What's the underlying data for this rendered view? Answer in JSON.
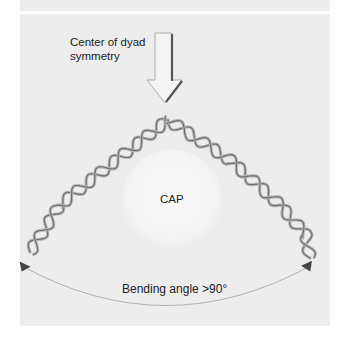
{
  "figure": {
    "labels": {
      "center": "Center of dyad symmetry",
      "protein": "CAP",
      "angle": "Bending angle >90°"
    },
    "colors": {
      "background": "#ededed",
      "dna_strand": "#707070",
      "dna_light": "#b8b8b8",
      "arrow_fill": "#f4f4f4",
      "arrow_shadow": "#555555",
      "arc": "#b0b0b0",
      "cap_fill": "#f6f6f6"
    },
    "icons": [
      "down-arrow-icon",
      "double-headed-arc-arrow-icon"
    ]
  }
}
